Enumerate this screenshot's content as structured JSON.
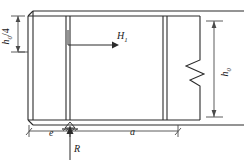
{
  "diagram": {
    "labels": {
      "height_quarter": "h",
      "height_quarter_sub": "0",
      "height_quarter_frac": "/4",
      "height_full": "h",
      "height_full_sub": "0",
      "force_horizontal": "H",
      "force_horizontal_sub": "1",
      "dim_e": "e",
      "dim_a": "a",
      "reaction": "R"
    },
    "colors": {
      "line": "#2b2b2b",
      "thin_line": "#4a4a4a",
      "background": "#ffffff",
      "text": "#1a1a1a"
    },
    "annotations": {
      "break_symbol": "break-line-zigzag",
      "support_symbol": "pin-support-triangle",
      "arrow_h1": "arrow-right",
      "arrow_r": "arrow-up"
    },
    "geometry": {
      "web_left_x": 28,
      "web_right_x": 200,
      "web_top_y": 16,
      "web_bottom_y": 120,
      "flange_offset": 5,
      "stiffener_1_x": 66,
      "stiffener_2_x": 163,
      "h0_quarter_y": 52,
      "dim_line_y": 131,
      "support_x": 70
    }
  }
}
